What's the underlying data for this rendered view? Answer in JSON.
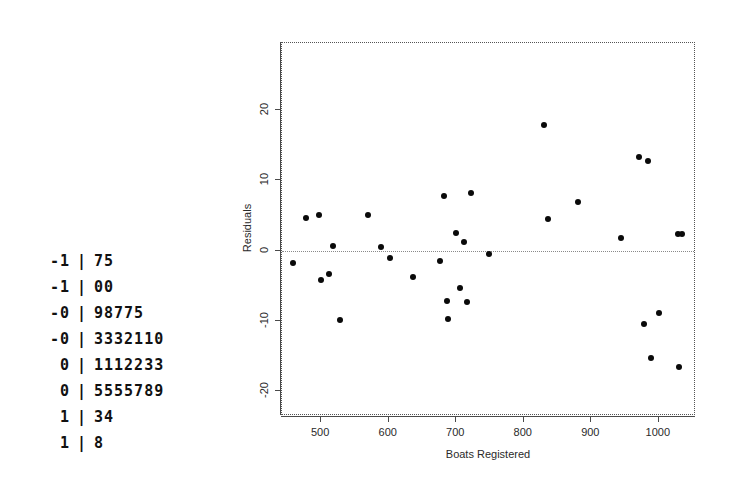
{
  "stem_leaf": {
    "name": "stem-and-leaf-display",
    "separator": "|",
    "rows": [
      {
        "stem": "-1",
        "leaf": "75"
      },
      {
        "stem": "-1",
        "leaf": "00"
      },
      {
        "stem": "-0",
        "leaf": "98775"
      },
      {
        "stem": "-0",
        "leaf": "3332110"
      },
      {
        "stem": "0",
        "leaf": "1112233"
      },
      {
        "stem": "0",
        "leaf": "5555789"
      },
      {
        "stem": "1",
        "leaf": "34"
      },
      {
        "stem": "1",
        "leaf": "8"
      }
    ]
  },
  "chart_data": {
    "type": "scatter",
    "title": "",
    "xlabel": "Boats Registered",
    "ylabel": "Residuals",
    "xlim": [
      442,
      1055
    ],
    "ylim": [
      -23.5,
      29.5
    ],
    "xticks": [
      500,
      600,
      700,
      800,
      900,
      1000
    ],
    "yticks": [
      -20,
      -10,
      0,
      10,
      20
    ],
    "xticklabels": [
      "500",
      "600",
      "700",
      "800",
      "900",
      "1000"
    ],
    "yticklabels": [
      "-20",
      "-10",
      "0",
      "10",
      "20"
    ],
    "grid": false,
    "legend": null,
    "reference_line": {
      "orientation": "horizontal",
      "y": 0,
      "style": "dotted"
    },
    "points": [
      {
        "x": 458,
        "y": -1.8
      },
      {
        "x": 478,
        "y": 4.7
      },
      {
        "x": 497,
        "y": 5.0
      },
      {
        "x": 500,
        "y": -4.2
      },
      {
        "x": 512,
        "y": -3.3
      },
      {
        "x": 518,
        "y": 0.7
      },
      {
        "x": 528,
        "y": -9.8
      },
      {
        "x": 570,
        "y": 5.0
      },
      {
        "x": 588,
        "y": 0.5
      },
      {
        "x": 602,
        "y": -1.0
      },
      {
        "x": 636,
        "y": -3.7
      },
      {
        "x": 676,
        "y": -1.5
      },
      {
        "x": 682,
        "y": 7.7
      },
      {
        "x": 686,
        "y": -7.2
      },
      {
        "x": 688,
        "y": -9.7
      },
      {
        "x": 700,
        "y": 2.5
      },
      {
        "x": 706,
        "y": -5.3
      },
      {
        "x": 712,
        "y": 1.2
      },
      {
        "x": 716,
        "y": -7.3
      },
      {
        "x": 722,
        "y": 8.2
      },
      {
        "x": 748,
        "y": -0.5
      },
      {
        "x": 830,
        "y": 17.8
      },
      {
        "x": 836,
        "y": 4.5
      },
      {
        "x": 880,
        "y": 6.9
      },
      {
        "x": 944,
        "y": 1.8
      },
      {
        "x": 970,
        "y": 13.3
      },
      {
        "x": 978,
        "y": -10.4
      },
      {
        "x": 984,
        "y": 12.8
      },
      {
        "x": 988,
        "y": -15.2
      },
      {
        "x": 1000,
        "y": -8.9
      },
      {
        "x": 1028,
        "y": 2.3
      },
      {
        "x": 1034,
        "y": 2.4
      },
      {
        "x": 1030,
        "y": -16.6
      }
    ]
  }
}
